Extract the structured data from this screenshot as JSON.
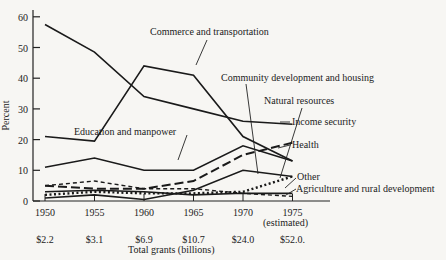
{
  "chart_data": {
    "type": "line",
    "title": "",
    "xlabel": "Total grants (billions)",
    "ylabel": "Percent",
    "ylim": [
      0,
      60
    ],
    "yticks": [
      0,
      10,
      20,
      30,
      40,
      50,
      60
    ],
    "x": [
      1950,
      1955,
      1960,
      1965,
      1970,
      1975
    ],
    "x_tick_labels": [
      "1950",
      "1955",
      "1960",
      "1965",
      "1970",
      "1975"
    ],
    "x_tick_sublabel": "(estimated)",
    "total_grants_labels": [
      "$2.2",
      "$3.1",
      "$6.9",
      "$10.7",
      "$24.0",
      "$52.0."
    ],
    "grid": false,
    "legend": "inline annotations",
    "series": [
      {
        "name": "Income security",
        "style": "solid",
        "values": [
          57.5,
          48.5,
          34,
          30,
          26,
          25
        ]
      },
      {
        "name": "Commerce and transportation",
        "style": "solid",
        "values": [
          21,
          19.5,
          44,
          41,
          21,
          13
        ]
      },
      {
        "name": "Education and manpower",
        "style": "solid",
        "values": [
          11,
          14,
          10,
          10,
          18,
          13
        ]
      },
      {
        "name": "Health",
        "style": "long-dash",
        "values": [
          5,
          4,
          4,
          6.5,
          15,
          19
        ]
      },
      {
        "name": "Community development and housing",
        "style": "solid",
        "values": [
          1,
          2,
          0.5,
          3.5,
          10,
          8
        ]
      },
      {
        "name": "Other",
        "style": "short-dash",
        "values": [
          5,
          6.5,
          4,
          4,
          2.5,
          1.5
        ]
      },
      {
        "name": "Natural resources",
        "style": "dotted",
        "values": [
          2,
          3,
          2.5,
          2.5,
          3,
          8
        ]
      },
      {
        "name": "Agriculture and rural development",
        "style": "solid",
        "values": [
          3,
          3.5,
          3,
          2,
          2.5,
          2.5
        ]
      }
    ],
    "annotations": [
      "Commerce and transportation",
      "Community development and housing",
      "Natural resources",
      "Income security",
      "Health",
      "Education and manpower",
      "Other",
      "Agriculture and rural development"
    ]
  },
  "labels": {
    "ylabel": "Percent",
    "xlabel": "Total grants (billions)",
    "commerce": "Commerce and transportation",
    "community": "Community development and housing",
    "natural": "Natural resources",
    "income": "Income security",
    "health": "Health",
    "education": "Education and manpower",
    "other": "Other",
    "agriculture": "Agriculture and rural development",
    "estimated": "(estimated)"
  }
}
